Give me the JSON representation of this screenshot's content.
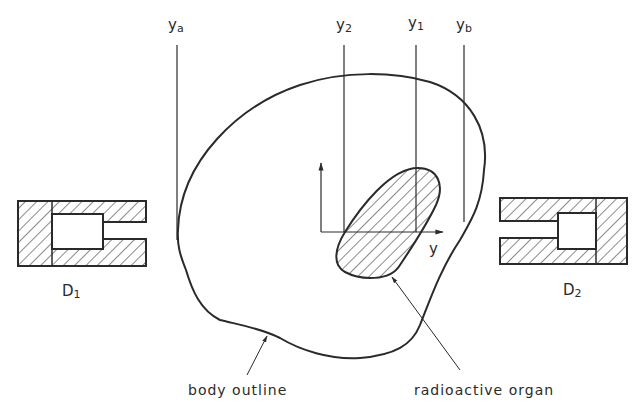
{
  "figure": {
    "projection_lines": [
      {
        "id": "ya",
        "base": "y",
        "sub": "a"
      },
      {
        "id": "y2",
        "base": "y",
        "sub": "2"
      },
      {
        "id": "y1",
        "base": "y",
        "sub": "1"
      },
      {
        "id": "yb",
        "base": "y",
        "sub": "b"
      }
    ],
    "axis_label": "y",
    "detectors": [
      {
        "id": "D1",
        "base": "D",
        "sub": "1"
      },
      {
        "id": "D2",
        "base": "D",
        "sub": "2"
      }
    ],
    "callouts": {
      "body": "body outline",
      "organ": "radioactive organ"
    },
    "colors": {
      "line": "#2a2a2a",
      "background": "#ffffff"
    }
  }
}
